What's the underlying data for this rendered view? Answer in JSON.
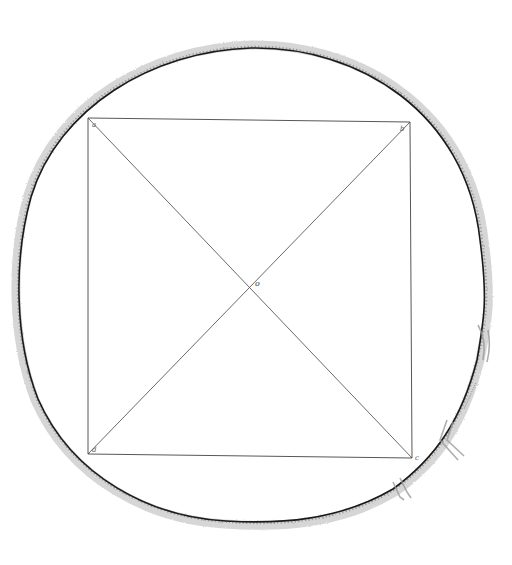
{
  "diagram": {
    "type": "geometric-figure",
    "center_label": "o",
    "corner_labels": [
      "a",
      "b",
      "c",
      "d"
    ],
    "colors": {
      "background": "#ffffff",
      "circle_line": "#1a1a1a",
      "circle_shading": "#9a9a9a",
      "construction_lines": "#444444"
    },
    "shapes": {
      "circle": {
        "cx": 251,
        "cy": 285,
        "rx": 238,
        "ry": 243
      },
      "square": {
        "top_left": [
          88,
          118
        ],
        "top_right": [
          410,
          122
        ],
        "bottom_right": [
          412,
          458
        ],
        "bottom_left": [
          88,
          454
        ]
      },
      "center": [
        252,
        287
      ]
    }
  }
}
